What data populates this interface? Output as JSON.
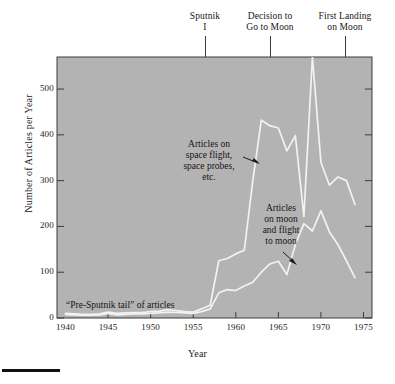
{
  "figure": {
    "bottom_rule": "",
    "plot_background": "#b3b3b3",
    "line_color": "#f2f2f2",
    "frame_color": "#3c3c3c"
  },
  "axes": {
    "xlabel": "Year",
    "ylabel": "Number of Articles per Year",
    "xticks": [
      "1940",
      "1945",
      "1950",
      "1955",
      "1960",
      "1965",
      "1970",
      "1975"
    ],
    "yticks": [
      "0",
      "100",
      "200",
      "300",
      "400",
      "500"
    ]
  },
  "callouts": {
    "sputnik": "Sputnik\nI",
    "decision": "Decision to\nGo to Moon",
    "landing": "First Landing\non Moon"
  },
  "notes": {
    "spaceflight": "Articles on\nspace flight,\nspace probes,\netc.",
    "moon": "Articles\non moon\nand flight\nto moon",
    "tail": "“Pre-Sputnik tail” of articles"
  },
  "chart_data": {
    "type": "line",
    "title": "",
    "xlabel": "Year",
    "ylabel": "Number of Articles per Year",
    "xlim": [
      1939,
      1976
    ],
    "ylim": [
      0,
      570
    ],
    "grid": false,
    "legend": "inline-annotations",
    "xticks": [
      1940,
      1945,
      1950,
      1955,
      1960,
      1965,
      1970,
      1975
    ],
    "yticks": [
      0,
      100,
      200,
      300,
      400,
      500
    ],
    "event_markers": [
      {
        "label": "Sputnik I",
        "year": 1957.5
      },
      {
        "label": "Decision to Go to Moon",
        "year": 1961.0
      },
      {
        "label": "First Landing on Moon",
        "year": 1969.3
      },
      {
        "label": "“Pre-Sputnik tail” of articles",
        "year": 1946
      }
    ],
    "x": [
      1940,
      1941,
      1942,
      1943,
      1944,
      1945,
      1946,
      1947,
      1948,
      1949,
      1950,
      1951,
      1952,
      1953,
      1954,
      1955,
      1956,
      1957,
      1958,
      1959,
      1960,
      1961,
      1962,
      1963,
      1964,
      1965,
      1966,
      1967,
      1968,
      1969,
      1970,
      1971,
      1972,
      1973,
      1974
    ],
    "series": [
      {
        "name": "Articles on space flight, space probes, etc.",
        "values": [
          10,
          9,
          8,
          8,
          9,
          13,
          10,
          11,
          12,
          12,
          14,
          15,
          18,
          16,
          14,
          13,
          20,
          28,
          125,
          130,
          140,
          148,
          300,
          432,
          420,
          415,
          365,
          398,
          222,
          570,
          340,
          290,
          308,
          300,
          248
        ]
      },
      {
        "name": "Articles on moon and flight to moon",
        "values": [
          8,
          7,
          6,
          6,
          7,
          10,
          7,
          8,
          9,
          9,
          10,
          11,
          13,
          12,
          11,
          10,
          14,
          20,
          55,
          62,
          60,
          70,
          78,
          100,
          118,
          124,
          95,
          160,
          206,
          190,
          234,
          188,
          160,
          125,
          88
        ]
      }
    ]
  }
}
